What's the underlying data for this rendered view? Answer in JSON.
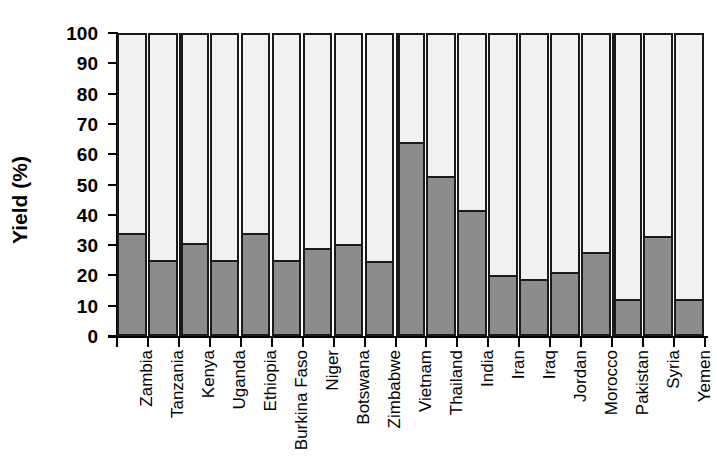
{
  "chart": {
    "type": "bar",
    "ylabel_text": "Yield (%)"
  },
  "chart_data": {
    "type": "bar",
    "title": "",
    "subtitle": "",
    "xlabel": "",
    "ylabel": "Yield (%)",
    "ylim": [
      0,
      100
    ],
    "yticks": [
      0,
      10,
      20,
      30,
      40,
      50,
      60,
      70,
      80,
      90,
      100
    ],
    "ytick_labels": [
      "0",
      "10",
      "20",
      "30",
      "40",
      "50",
      "60",
      "70",
      "80",
      "90",
      "100"
    ],
    "grid": false,
    "legend": null,
    "stacked": true,
    "bar_style": {
      "lower_segment_color": "#8c8c8c",
      "upper_segment_color": "#f1f1f1",
      "outline_color": "#1a1a1a"
    },
    "categories": [
      "Zambia",
      "Tanzania",
      "Kenya",
      "Uganda",
      "Ethiopia",
      "Burkina Faso",
      "Niger",
      "Botswana",
      "Zimbabwe",
      "Vietnam",
      "Thailand",
      "India",
      "Iran",
      "Iraq",
      "Jordan",
      "Morocco",
      "Pakistan",
      "Syria",
      "Yemen"
    ],
    "series": [
      {
        "name": "Yield achieved",
        "color": "#8c8c8c",
        "values": [
          33.5,
          24.5,
          30.0,
          24.5,
          33.5,
          24.5,
          28.5,
          29.7,
          24.2,
          63.5,
          52.0,
          41.0,
          19.5,
          18.3,
          20.5,
          27.0,
          11.5,
          32.5,
          11.5
        ]
      },
      {
        "name": "Yield gap",
        "color": "#f1f1f1",
        "values": [
          66.5,
          75.5,
          70.0,
          75.5,
          66.5,
          75.5,
          71.5,
          70.3,
          75.8,
          36.5,
          48.0,
          59.0,
          80.5,
          81.7,
          79.5,
          73.0,
          88.5,
          67.5,
          88.5
        ]
      }
    ],
    "group_separators_after": [
      "Tanzania",
      "Zimbabwe",
      "Morocco"
    ]
  }
}
